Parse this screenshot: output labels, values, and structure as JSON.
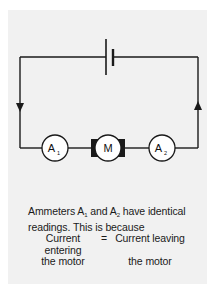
{
  "diagram": {
    "type": "series-circuit",
    "components": [
      {
        "id": "battery",
        "kind": "cell",
        "label": ""
      },
      {
        "id": "ammeter-1",
        "kind": "ammeter",
        "label": "A",
        "subscript": "1"
      },
      {
        "id": "motor",
        "kind": "motor",
        "label": "M"
      },
      {
        "id": "ammeter-2",
        "kind": "ammeter",
        "label": "A",
        "subscript": "2"
      }
    ],
    "current_direction": "left wire downward, right wire upward",
    "colors": {
      "wire": "#1a1a1a",
      "panel_background": "#f1f1f1",
      "page_background": "#ffffff"
    }
  },
  "caption": {
    "line1_prefix": "Ammeters A",
    "line1_sub1": "1",
    "line1_mid": " and A",
    "line1_sub2": "2",
    "line1_suffix": " have identical",
    "line2": "readings. This is because",
    "equation": {
      "left_top": "Current entering",
      "left_bottom": "the motor",
      "sign": "=",
      "right_top": "Current leaving",
      "right_bottom": "the motor"
    }
  }
}
